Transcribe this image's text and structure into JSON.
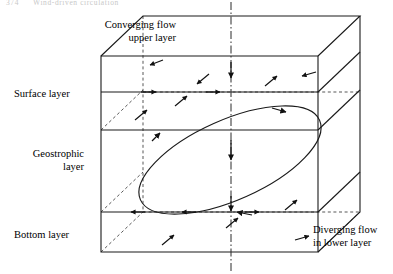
{
  "running_head": {
    "folio": "374",
    "title": "Wind-driven circulation"
  },
  "figure": {
    "type": "diagram",
    "labels": {
      "converging_line1": "Converging flow",
      "converging_line2": "upper layer",
      "surface_layer": "Surface layer",
      "geostrophic_line1": "Geostrophic",
      "geostrophic_line2": "layer",
      "bottom_layer": "Bottom layer",
      "diverging_line1": "Diverging flow",
      "diverging_line2": "in lower layer"
    },
    "colors": {
      "stroke": "#1a1a1a",
      "hidden_stroke": "#3a3a3a",
      "axis_stroke": "#2a2a2a",
      "background": "#ffffff"
    },
    "geometry": {
      "front_face": {
        "left_x": 101,
        "right_x": 318,
        "top_y": 56,
        "bottom_y": 252
      },
      "depth_offset": {
        "dx": 42,
        "dy": -40
      },
      "layer_boundaries_front_y": [
        56,
        92,
        130,
        212,
        252
      ],
      "center_axis_x": 231
    },
    "elements": {
      "vertical_axis": "dash-dot centre line with downward arrowheads",
      "gyre": "tilted ellipse representing the geostrophic gyre",
      "surface_arrows": "arrows converging toward the centre axis",
      "bottom_arrows": "arrows diverging away from the centre axis"
    }
  }
}
